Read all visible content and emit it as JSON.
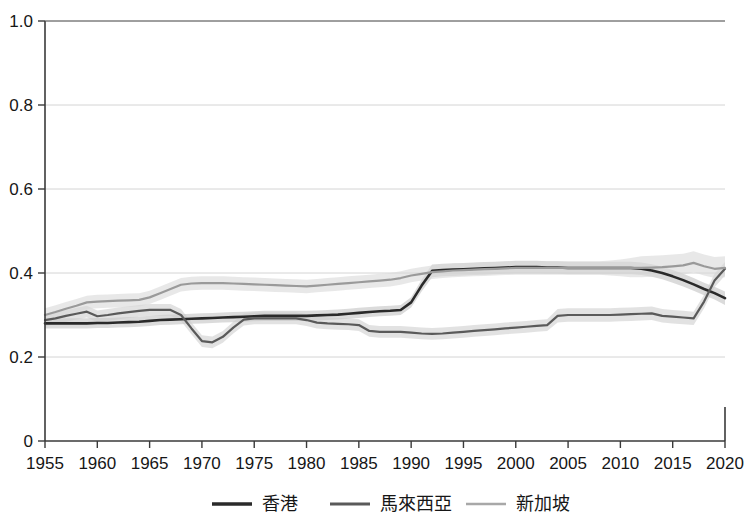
{
  "chart_data": {
    "type": "line",
    "title": "",
    "xlabel": "",
    "ylabel": "",
    "xlim": [
      1955,
      2020
    ],
    "ylim": [
      0,
      1.0
    ],
    "grid": true,
    "legend_position": "bottom",
    "x_ticks": [
      "1955",
      "1960",
      "1965",
      "1970",
      "1975",
      "1980",
      "1985",
      "1990",
      "1995",
      "2000",
      "2005",
      "2010",
      "2015",
      "2020"
    ],
    "x_tick_values": [
      1955,
      1960,
      1965,
      1970,
      1975,
      1980,
      1985,
      1990,
      1995,
      2000,
      2005,
      2010,
      2015,
      2020
    ],
    "y_ticks": [
      "0",
      "0.2",
      "0.4",
      "0.6",
      "0.8",
      "1.0"
    ],
    "y_tick_values": [
      0,
      0.2,
      0.4,
      0.6,
      0.8,
      1.0
    ],
    "x": [
      1955,
      1956,
      1957,
      1958,
      1959,
      1960,
      1961,
      1962,
      1963,
      1964,
      1965,
      1966,
      1967,
      1968,
      1969,
      1970,
      1971,
      1972,
      1973,
      1974,
      1975,
      1976,
      1977,
      1978,
      1979,
      1980,
      1981,
      1982,
      1983,
      1984,
      1985,
      1986,
      1987,
      1988,
      1989,
      1990,
      1991,
      1992,
      1993,
      1994,
      1995,
      1996,
      1997,
      1998,
      1999,
      2000,
      2001,
      2002,
      2003,
      2004,
      2005,
      2006,
      2007,
      2008,
      2009,
      2010,
      2011,
      2012,
      2013,
      2014,
      2015,
      2016,
      2017,
      2018,
      2019,
      2020
    ],
    "series": [
      {
        "name": "香港",
        "color": "#2a2a2a",
        "width": 2.6,
        "band_color": "#bdbdbd",
        "band_opacity": 0.55,
        "values": [
          0.28,
          0.28,
          0.28,
          0.28,
          0.28,
          0.281,
          0.281,
          0.282,
          0.283,
          0.284,
          0.286,
          0.288,
          0.289,
          0.29,
          0.291,
          0.292,
          0.293,
          0.294,
          0.295,
          0.296,
          0.297,
          0.298,
          0.298,
          0.298,
          0.298,
          0.298,
          0.299,
          0.3,
          0.301,
          0.303,
          0.305,
          0.307,
          0.309,
          0.31,
          0.312,
          0.33,
          0.37,
          0.405,
          0.407,
          0.408,
          0.409,
          0.41,
          0.411,
          0.412,
          0.413,
          0.414,
          0.414,
          0.414,
          0.413,
          0.413,
          0.412,
          0.412,
          0.412,
          0.412,
          0.412,
          0.412,
          0.412,
          0.41,
          0.406,
          0.4,
          0.392,
          0.383,
          0.373,
          0.362,
          0.352,
          0.34
        ],
        "band_lower": [
          0.268,
          0.268,
          0.268,
          0.268,
          0.268,
          0.269,
          0.269,
          0.27,
          0.271,
          0.272,
          0.274,
          0.276,
          0.277,
          0.278,
          0.279,
          0.28,
          0.281,
          0.282,
          0.283,
          0.284,
          0.285,
          0.286,
          0.286,
          0.286,
          0.286,
          0.286,
          0.287,
          0.288,
          0.289,
          0.291,
          0.293,
          0.295,
          0.297,
          0.298,
          0.3,
          0.318,
          0.356,
          0.39,
          0.392,
          0.393,
          0.394,
          0.395,
          0.396,
          0.397,
          0.398,
          0.399,
          0.399,
          0.399,
          0.398,
          0.398,
          0.397,
          0.397,
          0.397,
          0.397,
          0.397,
          0.397,
          0.397,
          0.395,
          0.391,
          0.385,
          0.377,
          0.368,
          0.358,
          0.347,
          0.337,
          0.324
        ],
        "band_upper": [
          0.292,
          0.292,
          0.292,
          0.292,
          0.292,
          0.293,
          0.293,
          0.294,
          0.295,
          0.296,
          0.298,
          0.3,
          0.301,
          0.302,
          0.303,
          0.304,
          0.305,
          0.306,
          0.307,
          0.308,
          0.309,
          0.31,
          0.31,
          0.31,
          0.31,
          0.31,
          0.311,
          0.312,
          0.313,
          0.315,
          0.317,
          0.319,
          0.321,
          0.322,
          0.324,
          0.342,
          0.384,
          0.42,
          0.422,
          0.423,
          0.424,
          0.425,
          0.426,
          0.427,
          0.428,
          0.429,
          0.429,
          0.429,
          0.428,
          0.428,
          0.427,
          0.427,
          0.427,
          0.427,
          0.427,
          0.427,
          0.427,
          0.425,
          0.421,
          0.415,
          0.407,
          0.398,
          0.388,
          0.377,
          0.367,
          0.356
        ]
      },
      {
        "name": "馬來西亞",
        "color": "#5a5a5a",
        "width": 2.2,
        "band_color": "#cacaca",
        "band_opacity": 0.55,
        "values": [
          0.288,
          0.292,
          0.298,
          0.303,
          0.308,
          0.297,
          0.3,
          0.304,
          0.307,
          0.31,
          0.312,
          0.312,
          0.312,
          0.3,
          0.268,
          0.238,
          0.235,
          0.248,
          0.27,
          0.289,
          0.292,
          0.292,
          0.292,
          0.292,
          0.292,
          0.288,
          0.282,
          0.28,
          0.279,
          0.278,
          0.276,
          0.262,
          0.26,
          0.26,
          0.26,
          0.258,
          0.256,
          0.255,
          0.256,
          0.258,
          0.26,
          0.262,
          0.264,
          0.266,
          0.268,
          0.27,
          0.272,
          0.274,
          0.276,
          0.298,
          0.3,
          0.3,
          0.3,
          0.3,
          0.3,
          0.301,
          0.302,
          0.303,
          0.304,
          0.298,
          0.296,
          0.294,
          0.292,
          0.332,
          0.382,
          0.41
        ],
        "band_lower": [
          0.274,
          0.278,
          0.284,
          0.289,
          0.294,
          0.283,
          0.286,
          0.29,
          0.293,
          0.296,
          0.298,
          0.298,
          0.298,
          0.286,
          0.254,
          0.224,
          0.221,
          0.234,
          0.256,
          0.275,
          0.278,
          0.278,
          0.278,
          0.278,
          0.278,
          0.274,
          0.268,
          0.266,
          0.265,
          0.264,
          0.262,
          0.248,
          0.246,
          0.246,
          0.246,
          0.244,
          0.242,
          0.241,
          0.242,
          0.244,
          0.246,
          0.248,
          0.25,
          0.252,
          0.254,
          0.256,
          0.258,
          0.26,
          0.262,
          0.282,
          0.284,
          0.284,
          0.284,
          0.284,
          0.284,
          0.285,
          0.286,
          0.287,
          0.288,
          0.282,
          0.28,
          0.278,
          0.276,
          0.316,
          0.366,
          0.394
        ],
        "band_upper": [
          0.302,
          0.306,
          0.312,
          0.317,
          0.322,
          0.311,
          0.314,
          0.318,
          0.321,
          0.324,
          0.326,
          0.326,
          0.326,
          0.314,
          0.282,
          0.252,
          0.249,
          0.262,
          0.284,
          0.303,
          0.306,
          0.306,
          0.306,
          0.306,
          0.306,
          0.302,
          0.296,
          0.294,
          0.293,
          0.292,
          0.29,
          0.276,
          0.274,
          0.274,
          0.274,
          0.272,
          0.27,
          0.269,
          0.27,
          0.272,
          0.274,
          0.276,
          0.278,
          0.28,
          0.282,
          0.284,
          0.286,
          0.288,
          0.29,
          0.314,
          0.316,
          0.316,
          0.316,
          0.316,
          0.316,
          0.317,
          0.318,
          0.319,
          0.32,
          0.314,
          0.312,
          0.31,
          0.308,
          0.348,
          0.398,
          0.426
        ]
      },
      {
        "name": "新加坡",
        "color": "#9a9a9a",
        "width": 2.2,
        "band_color": "#d8d8d8",
        "band_opacity": 0.6,
        "values": [
          0.3,
          0.307,
          0.315,
          0.322,
          0.33,
          0.332,
          0.333,
          0.334,
          0.335,
          0.336,
          0.342,
          0.352,
          0.362,
          0.372,
          0.375,
          0.376,
          0.376,
          0.376,
          0.375,
          0.374,
          0.373,
          0.372,
          0.371,
          0.37,
          0.369,
          0.368,
          0.37,
          0.372,
          0.374,
          0.376,
          0.378,
          0.38,
          0.382,
          0.384,
          0.388,
          0.394,
          0.398,
          0.402,
          0.404,
          0.406,
          0.407,
          0.408,
          0.409,
          0.41,
          0.411,
          0.412,
          0.412,
          0.412,
          0.412,
          0.412,
          0.412,
          0.412,
          0.412,
          0.412,
          0.412,
          0.412,
          0.412,
          0.412,
          0.413,
          0.414,
          0.416,
          0.418,
          0.424,
          0.416,
          0.41,
          0.412
        ],
        "band_lower": [
          0.284,
          0.291,
          0.299,
          0.306,
          0.314,
          0.316,
          0.317,
          0.318,
          0.319,
          0.32,
          0.326,
          0.336,
          0.346,
          0.356,
          0.359,
          0.36,
          0.36,
          0.36,
          0.359,
          0.358,
          0.357,
          0.356,
          0.355,
          0.354,
          0.353,
          0.352,
          0.354,
          0.356,
          0.358,
          0.36,
          0.362,
          0.364,
          0.366,
          0.368,
          0.372,
          0.378,
          0.382,
          0.386,
          0.388,
          0.39,
          0.391,
          0.392,
          0.393,
          0.394,
          0.395,
          0.396,
          0.396,
          0.396,
          0.396,
          0.396,
          0.396,
          0.396,
          0.396,
          0.396,
          0.394,
          0.392,
          0.39,
          0.39,
          0.391,
          0.392,
          0.394,
          0.396,
          0.402,
          0.394,
          0.388,
          0.39
        ],
        "band_upper": [
          0.316,
          0.323,
          0.331,
          0.338,
          0.346,
          0.348,
          0.349,
          0.35,
          0.351,
          0.352,
          0.358,
          0.368,
          0.378,
          0.388,
          0.391,
          0.392,
          0.392,
          0.392,
          0.391,
          0.39,
          0.389,
          0.388,
          0.387,
          0.386,
          0.385,
          0.384,
          0.386,
          0.388,
          0.39,
          0.392,
          0.394,
          0.396,
          0.398,
          0.4,
          0.404,
          0.41,
          0.414,
          0.418,
          0.42,
          0.422,
          0.423,
          0.424,
          0.425,
          0.426,
          0.427,
          0.428,
          0.428,
          0.428,
          0.428,
          0.428,
          0.428,
          0.428,
          0.428,
          0.428,
          0.43,
          0.432,
          0.436,
          0.44,
          0.441,
          0.442,
          0.444,
          0.446,
          0.452,
          0.444,
          0.438,
          0.44
        ]
      }
    ]
  },
  "legend": {
    "entries": [
      {
        "label": "香港",
        "color": "#2a2a2a",
        "width": 3.4
      },
      {
        "label": "馬來西亞",
        "color": "#5a5a5a",
        "width": 2.8
      },
      {
        "label": "新加坡",
        "color": "#a8a8a8",
        "width": 2.4
      }
    ]
  }
}
